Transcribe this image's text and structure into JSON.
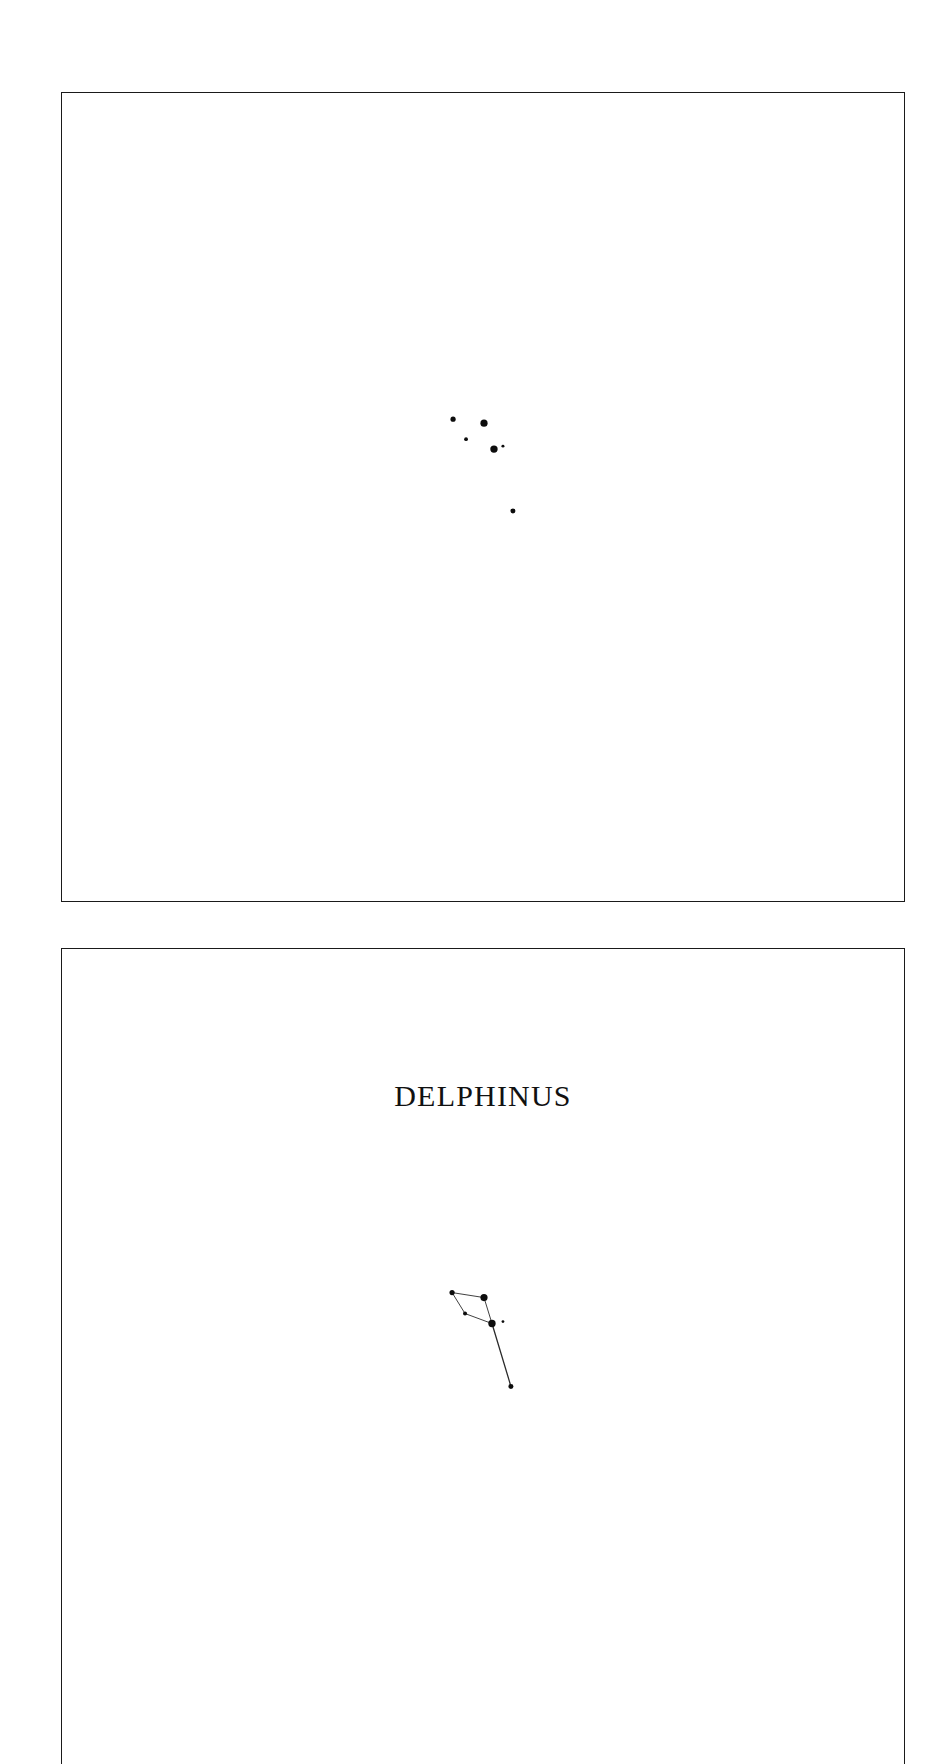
{
  "page": {
    "width": 952,
    "height": 1764,
    "background_color": "#ffffff",
    "ink_color": "#0d0d0d",
    "line_color": "#2b2b2b"
  },
  "panels": [
    {
      "id": "stars-only",
      "name": "star-chart-panel-plain",
      "border_color": "#1a1a1a",
      "title": "",
      "has_title": false,
      "has_constellation_lines": false
    },
    {
      "id": "labelled-figure",
      "name": "star-chart-panel-labelled",
      "border_color": "#1a1a1a",
      "title": "DELPHINUS",
      "has_title": true,
      "has_constellation_lines": true
    }
  ],
  "chart_data": {
    "type": "scatter",
    "title": "DELPHINUS",
    "xlabel": "",
    "ylabel": "",
    "xlim": [
      0,
      844
    ],
    "ylim": [
      0,
      810
    ],
    "grid": false,
    "legend": "none",
    "note": "Star chart of the constellation Delphinus. Panel 1 shows bare stars; panel 2 repeats the same field with the constellation name and stick-figure connecting lines. Marker radius encodes apparent brightness (larger = brighter).",
    "panel_plain": {
      "origin": {
        "x": 61,
        "y": 92
      },
      "stars": [
        {
          "label": "star-1",
          "x": 392,
          "y": 327,
          "r": 2.6,
          "magnitude_rank": 3
        },
        {
          "label": "star-2",
          "x": 423,
          "y": 331,
          "r": 3.6,
          "magnitude_rank": 1
        },
        {
          "label": "star-3",
          "x": 405,
          "y": 347,
          "r": 1.9,
          "magnitude_rank": 5
        },
        {
          "label": "star-4",
          "x": 433,
          "y": 357,
          "r": 3.7,
          "magnitude_rank": 1
        },
        {
          "label": "star-5",
          "x": 442,
          "y": 354,
          "r": 1.5,
          "magnitude_rank": 6
        },
        {
          "label": "star-6",
          "x": 452,
          "y": 419,
          "r": 2.5,
          "magnitude_rank": 4
        }
      ]
    },
    "panel_labelled": {
      "origin": {
        "x": 61,
        "y": 948
      },
      "title_position": {
        "x": 422,
        "y": 152
      },
      "stars": [
        {
          "label": "star-1",
          "x": 391,
          "y": 344,
          "r": 2.6,
          "magnitude_rank": 3
        },
        {
          "label": "star-2",
          "x": 423,
          "y": 349,
          "r": 3.6,
          "magnitude_rank": 1
        },
        {
          "label": "star-3",
          "x": 404,
          "y": 365,
          "r": 2.0,
          "magnitude_rank": 5
        },
        {
          "label": "star-4",
          "x": 431,
          "y": 375,
          "r": 3.7,
          "magnitude_rank": 1
        },
        {
          "label": "star-5",
          "x": 442,
          "y": 373,
          "r": 1.4,
          "magnitude_rank": 6
        },
        {
          "label": "star-6",
          "x": 450,
          "y": 438,
          "r": 2.5,
          "magnitude_rank": 4
        }
      ],
      "lines": [
        {
          "from": "star-1",
          "to": "star-2",
          "x1": 391,
          "y1": 344,
          "x2": 423,
          "y2": 349,
          "width": 0.9
        },
        {
          "from": "star-1",
          "to": "star-3",
          "x1": 391,
          "y1": 344,
          "x2": 404,
          "y2": 365,
          "width": 0.9
        },
        {
          "from": "star-3",
          "to": "star-4",
          "x1": 404,
          "y1": 365,
          "x2": 431,
          "y2": 375,
          "width": 0.9
        },
        {
          "from": "star-2",
          "to": "star-4",
          "x1": 423,
          "y1": 349,
          "x2": 431,
          "y2": 375,
          "width": 0.9
        },
        {
          "from": "star-4",
          "to": "star-6",
          "x1": 431,
          "y1": 375,
          "x2": 450,
          "y2": 438,
          "width": 1.3
        }
      ]
    }
  }
}
